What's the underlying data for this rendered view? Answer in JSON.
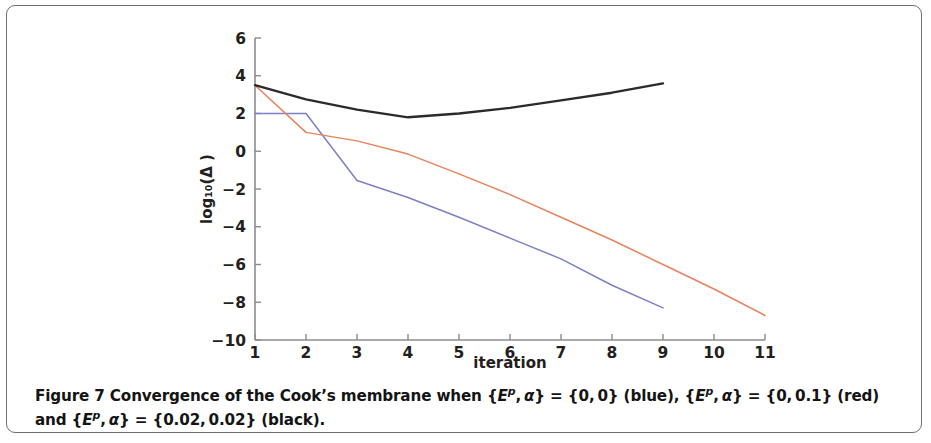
{
  "figure": {
    "number": "Figure 7",
    "caption_line1": "Figure 7 Convergence of the Cook’s membrane when {Eᵖ, α} = {0, 0} (blue), {Eᵖ, α} = {0, 0.1} (red)",
    "caption_line2": "and {Eᵖ, α} = {0.02, 0.02} (black).",
    "caption_full": "Figure 7 Convergence of the Cook’s membrane when {Eᵖ, α} = {0, 0} (blue), {Eᵖ, α} = {0, 0.1} (red) and {Eᵖ, α} = {0.02, 0.02} (black)."
  },
  "chart_data": {
    "type": "line",
    "title": "",
    "xlabel": "iteration",
    "ylabel": "log₁₀(Δ )",
    "xlim": [
      1,
      11
    ],
    "ylim": [
      -10,
      6
    ],
    "xticks": [
      1,
      2,
      3,
      4,
      5,
      6,
      7,
      8,
      9,
      10,
      11
    ],
    "xtick_labels": [
      "1",
      "2",
      "3",
      "4",
      "5",
      "6",
      "7",
      "8",
      "9",
      "10",
      "11"
    ],
    "yticks": [
      6,
      4,
      2,
      0,
      -2,
      -4,
      -6,
      -8,
      -10
    ],
    "ytick_labels": [
      "6",
      "4",
      "2",
      "0",
      "−2",
      "−4",
      "−6",
      "−8",
      "−10"
    ],
    "grid": false,
    "legend": "none (described in caption)",
    "series": [
      {
        "name": "{Eᵖ, α} = {0, 0} (blue)",
        "color": "#7b80c4",
        "x": [
          1,
          2,
          3,
          4,
          5,
          6,
          7,
          8,
          9
        ],
        "values": [
          2.0,
          2.0,
          -1.55,
          -2.45,
          -3.5,
          -4.6,
          -5.7,
          -7.1,
          -8.3
        ]
      },
      {
        "name": "{Eᵖ, α} = {0, 0.1} (red)",
        "color": "#e8825c",
        "x": [
          1,
          2,
          3,
          4,
          5,
          6,
          7,
          8,
          9,
          10,
          11
        ],
        "values": [
          3.5,
          1.0,
          0.55,
          -0.15,
          -1.2,
          -2.3,
          -3.5,
          -4.7,
          -6.0,
          -7.3,
          -8.7
        ]
      },
      {
        "name": "{Eᵖ, α} = {0.02, 0.02} (black)",
        "color": "#2b2b2b",
        "x": [
          1,
          2,
          3,
          4,
          5,
          6,
          7,
          8,
          9
        ],
        "values": [
          3.5,
          2.75,
          2.2,
          1.8,
          2.0,
          2.3,
          2.7,
          3.1,
          3.6
        ]
      }
    ]
  },
  "colors": {
    "blue": "#7b80c4",
    "red": "#e8825c",
    "black": "#2b2b2b",
    "axis": "#8c8c90",
    "frame": "#6e6e72"
  }
}
